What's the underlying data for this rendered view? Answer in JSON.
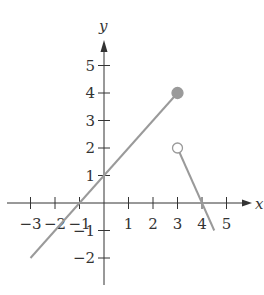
{
  "chart_data": {
    "type": "line",
    "title": "",
    "xlabel": "x",
    "ylabel": "y",
    "xlim": [
      -3.5,
      5.8
    ],
    "ylim": [
      -2.8,
      5.8
    ],
    "grid": false,
    "x_ticks": [
      -3,
      -2,
      -1,
      1,
      2,
      3,
      4,
      5
    ],
    "y_ticks": [
      -2,
      -1,
      1,
      2,
      3,
      4,
      5
    ],
    "x_tick_labels": [
      "−3",
      "−2",
      "−1",
      "1",
      "2",
      "3",
      "4",
      "5"
    ],
    "y_tick_labels": [
      "−2",
      "−1",
      "1",
      "2",
      "3",
      "4",
      "5"
    ],
    "series": [
      {
        "name": "left piece",
        "x": [
          -3,
          3
        ],
        "y": [
          -2,
          4
        ],
        "equation": "y = x + 1",
        "right_endpoint": "closed"
      },
      {
        "name": "right piece",
        "x": [
          3,
          4.5
        ],
        "y": [
          2,
          -1
        ],
        "equation": "y = -2x + 8",
        "left_endpoint": "open"
      }
    ],
    "points": [
      {
        "x": 3,
        "y": 4,
        "style": "filled"
      },
      {
        "x": 3,
        "y": 2,
        "style": "open"
      }
    ],
    "line_color": "#9a9a9a",
    "axis_color": "#333333"
  }
}
